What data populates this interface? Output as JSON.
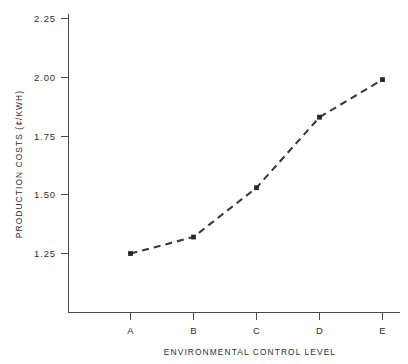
{
  "chart_data": {
    "type": "line",
    "title": "",
    "subtitle": "",
    "xlabel": "ENVIRONMENTAL  CONTROL   LEVEL",
    "ylabel": "PRODUCTION  COSTS  (¢/KWH)",
    "categories": [
      "A",
      "B",
      "C",
      "D",
      "E"
    ],
    "values": [
      1.25,
      1.32,
      1.53,
      1.83,
      1.99
    ],
    "series": [
      {
        "name": "Production costs",
        "values": [
          1.25,
          1.32,
          1.53,
          1.83,
          1.99
        ]
      }
    ],
    "ylim": [
      1.15,
      2.25
    ],
    "yticks": [
      1.25,
      1.5,
      1.75,
      2.0,
      2.25
    ],
    "ytick_labels": [
      "1.25",
      "1.50",
      "1.75",
      "2.00",
      "2.25"
    ],
    "xtick_labels": [
      "A",
      "B",
      "C",
      "D",
      "E"
    ],
    "grid": false,
    "legend": "none",
    "line_style": "dashed",
    "marker": "filled-square",
    "colors": {
      "line": "#3a3a3a",
      "marker": "#272727",
      "axis": "#4a4a4a",
      "text": "#2e2e2e",
      "background": "#ffffff"
    }
  },
  "axes": {
    "y_tick_0": "1.25",
    "y_tick_1": "1.50",
    "y_tick_2": "1.75",
    "y_tick_3": "2.00",
    "y_tick_4": "2.25",
    "x_tick_0": "A",
    "x_tick_1": "B",
    "x_tick_2": "C",
    "x_tick_3": "D",
    "x_tick_4": "E",
    "x_axis_title": "ENVIRONMENTAL  CONTROL   LEVEL",
    "y_axis_title": "PRODUCTION  COSTS  (¢/KWH)"
  }
}
